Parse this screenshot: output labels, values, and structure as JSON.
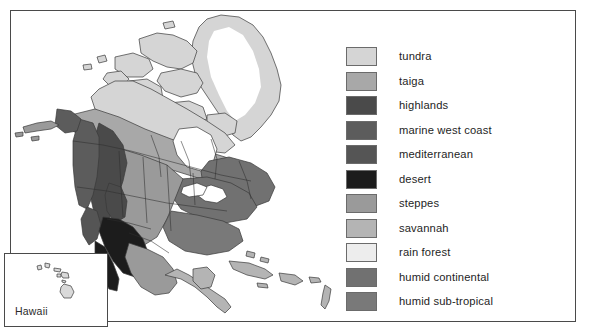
{
  "map": {
    "title": "North America Climate Zones",
    "inset": {
      "label": "Hawaii"
    }
  },
  "legend": {
    "items": [
      {
        "label": "tundra",
        "color": "#d5d5d5"
      },
      {
        "label": "taiga",
        "color": "#a8a8a8"
      },
      {
        "label": "highlands",
        "color": "#4a4a4a"
      },
      {
        "label": "marine west coast",
        "color": "#5c5c5c"
      },
      {
        "label": "mediterranean",
        "color": "#555555"
      },
      {
        "label": "desert",
        "color": "#1c1c1c"
      },
      {
        "label": "steppes",
        "color": "#9a9a9a"
      },
      {
        "label": "savannah",
        "color": "#b4b4b4"
      },
      {
        "label": "rain forest",
        "color": "#ededed"
      },
      {
        "label": "humid continental",
        "color": "#717171"
      },
      {
        "label": "humid sub-tropical",
        "color": "#797979"
      }
    ]
  }
}
